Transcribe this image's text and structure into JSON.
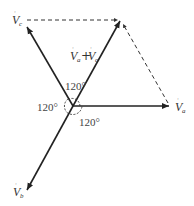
{
  "diagram": {
    "type": "phasor-diagram",
    "origin": [
      73,
      106
    ],
    "vectors": [
      {
        "name": "Va",
        "label": "V",
        "sub": "a",
        "tip": [
          170,
          106
        ],
        "style": "solid"
      },
      {
        "name": "Vb",
        "label": "V",
        "sub": "b",
        "tip": [
          27,
          190
        ],
        "style": "solid"
      },
      {
        "name": "Vc",
        "label": "V",
        "sub": "c",
        "tip": [
          26,
          26
        ],
        "style": "solid"
      },
      {
        "name": "Va+Vc",
        "label": "V",
        "sub": "a",
        "plus": "+",
        "label2": "V",
        "sub2": "c",
        "tip": [
          121,
          20
        ],
        "style": "solid"
      }
    ],
    "dashed_lines": [
      {
        "from": [
          26,
          20
        ],
        "to": [
          121,
          20
        ]
      },
      {
        "from": [
          121,
          22
        ],
        "to": [
          168,
          104
        ]
      }
    ],
    "angles": [
      {
        "text": "120°",
        "position": "top"
      },
      {
        "text": "120°",
        "position": "left"
      },
      {
        "text": "120°",
        "position": "bottom-right"
      }
    ]
  }
}
